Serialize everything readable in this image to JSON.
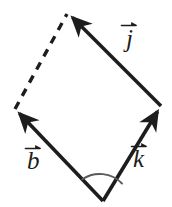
{
  "figure": {
    "type": "vector-diagram",
    "background_color": "#ffffff",
    "stroke_color": "#1d1d1d",
    "arc_color": "#555555",
    "canvas": {
      "width": 172,
      "height": 207
    },
    "vertices": {
      "bottom": {
        "x": 103,
        "y": 201
      },
      "left": {
        "x": 15,
        "y": 109
      },
      "right": {
        "x": 161,
        "y": 106
      },
      "top": {
        "x": 68,
        "y": 13
      }
    },
    "vectors": [
      {
        "name": "b",
        "label": "b",
        "style": "solid",
        "arrowhead": true,
        "from": "bottom",
        "to": "left",
        "x1": 103,
        "y1": 201,
        "x2": 15,
        "y2": 109
      },
      {
        "name": "k",
        "label": "k",
        "style": "solid",
        "arrowhead": true,
        "from": "bottom",
        "to": "right",
        "x1": 103,
        "y1": 201,
        "x2": 161,
        "y2": 106
      },
      {
        "name": "j",
        "label": "j",
        "style": "solid",
        "arrowhead": true,
        "from": "right",
        "to": "top",
        "x1": 161,
        "y1": 106,
        "x2": 68,
        "y2": 13
      },
      {
        "name": "dashed-side",
        "label": "",
        "style": "dashed",
        "arrowhead": false,
        "from": "left",
        "to": "top",
        "x1": 15,
        "y1": 109,
        "x2": 68,
        "y2": 13
      }
    ],
    "angle_arc": {
      "at_vertex": "bottom",
      "between": [
        "b",
        "k"
      ],
      "radius": 30
    },
    "labels": {
      "j": "j",
      "b": "b",
      "k": "k"
    }
  }
}
